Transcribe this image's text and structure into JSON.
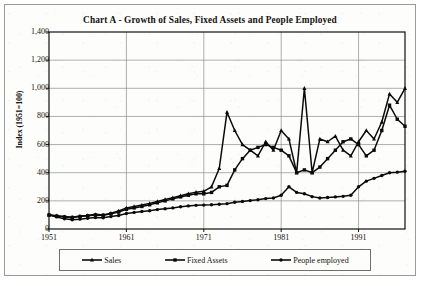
{
  "chart_data": {
    "type": "line",
    "title": "Chart A - Growth of Sales, Fixed Assets and People Employed",
    "xlabel": "",
    "ylabel": "Index (1951=100)",
    "ylim": [
      0,
      1400
    ],
    "ytick_labels": [
      "0",
      "200",
      "400",
      "600",
      "800",
      "1,000",
      "1,200",
      "1,400"
    ],
    "ytick_values": [
      0,
      200,
      400,
      600,
      800,
      1000,
      1200,
      1400
    ],
    "xlim": [
      1951,
      1997
    ],
    "xtick_labels": [
      "1951",
      "1961",
      "1971",
      "1981",
      "1991"
    ],
    "xtick_values": [
      1951,
      1961,
      1971,
      1981,
      1991
    ],
    "grid": true,
    "legend_position": "bottom",
    "x": [
      1951,
      1952,
      1953,
      1954,
      1955,
      1956,
      1957,
      1958,
      1959,
      1960,
      1961,
      1962,
      1963,
      1964,
      1965,
      1966,
      1967,
      1968,
      1969,
      1970,
      1971,
      1972,
      1973,
      1974,
      1975,
      1976,
      1977,
      1978,
      1979,
      1980,
      1981,
      1982,
      1983,
      1984,
      1985,
      1986,
      1987,
      1988,
      1989,
      1990,
      1991,
      1992,
      1993,
      1994,
      1995,
      1996,
      1997
    ],
    "series": [
      {
        "name": "Sales",
        "marker": "triangle",
        "values": [
          100,
          95,
          88,
          84,
          92,
          96,
          104,
          100,
          112,
          128,
          150,
          160,
          170,
          182,
          196,
          210,
          222,
          236,
          250,
          262,
          268,
          300,
          430,
          830,
          700,
          600,
          560,
          520,
          620,
          560,
          700,
          640,
          400,
          1000,
          400,
          640,
          620,
          660,
          560,
          520,
          620,
          700,
          640,
          760,
          960,
          900,
          1000
        ]
      },
      {
        "name": "Fixed Assets",
        "marker": "square",
        "values": [
          100,
          92,
          86,
          82,
          88,
          94,
          100,
          98,
          108,
          120,
          140,
          150,
          160,
          172,
          186,
          200,
          214,
          228,
          240,
          250,
          250,
          260,
          300,
          310,
          420,
          500,
          560,
          580,
          600,
          580,
          560,
          520,
          400,
          420,
          400,
          440,
          500,
          560,
          620,
          640,
          600,
          520,
          560,
          700,
          880,
          780,
          730
        ]
      },
      {
        "name": "People employed",
        "marker": "circle",
        "values": [
          100,
          86,
          72,
          66,
          70,
          76,
          82,
          80,
          88,
          96,
          110,
          118,
          124,
          130,
          138,
          144,
          150,
          158,
          164,
          168,
          170,
          172,
          176,
          180,
          190,
          196,
          202,
          208,
          216,
          220,
          240,
          300,
          260,
          250,
          230,
          220,
          224,
          228,
          232,
          240,
          300,
          340,
          360,
          380,
          400,
          404,
          410
        ]
      }
    ]
  },
  "legend": {
    "items": [
      {
        "label": "Sales"
      },
      {
        "label": "Fixed Assets"
      },
      {
        "label": "People employed"
      }
    ]
  }
}
